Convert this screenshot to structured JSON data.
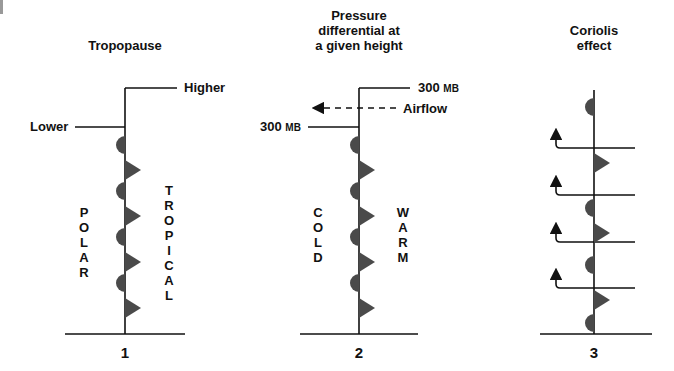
{
  "diagram": {
    "panels": [
      {
        "id": "1",
        "title": [
          "Tropopause"
        ],
        "number": "1",
        "labels": {
          "higher": "Higher",
          "lower": "Lower"
        },
        "left_vertical": "POLAR",
        "right_vertical": "TROPICAL"
      },
      {
        "id": "2",
        "title": [
          "Pressure",
          "differential at",
          "a given height"
        ],
        "number": "2",
        "labels": {
          "upper_value": "300",
          "upper_unit": "MB",
          "lower_value": "300",
          "lower_unit": "MB",
          "airflow": "Airflow"
        },
        "left_vertical": "COLD",
        "right_vertical": "WARM"
      },
      {
        "id": "3",
        "title": [
          "Coriolis",
          "effect"
        ],
        "number": "3"
      }
    ],
    "colors": {
      "line": "#111111",
      "front_symbol": "#4a4a4a",
      "background": "#ffffff"
    },
    "icons": [
      "semicircle-warm-front-symbol",
      "triangle-cold-front-symbol",
      "up-arrow-icon",
      "left-dashed-arrow-icon"
    ]
  }
}
